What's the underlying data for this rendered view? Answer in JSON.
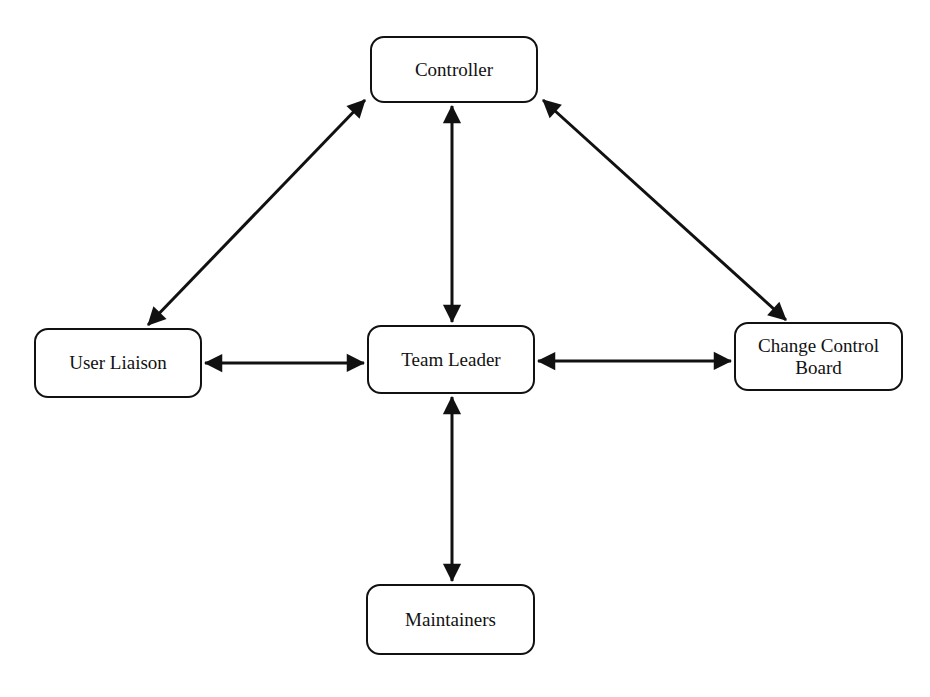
{
  "diagram": {
    "type": "organizational-communication-diagram",
    "nodes": {
      "controller": {
        "label": "Controller"
      },
      "user_liaison": {
        "label": "User Liaison"
      },
      "team_leader": {
        "label": "Team Leader"
      },
      "change_control_board": {
        "label": "Change Control Board"
      },
      "maintainers": {
        "label": "Maintainers"
      }
    },
    "edges": [
      {
        "from": "controller",
        "to": "user_liaison",
        "direction": "bidirectional"
      },
      {
        "from": "controller",
        "to": "team_leader",
        "direction": "bidirectional"
      },
      {
        "from": "controller",
        "to": "change_control_board",
        "direction": "bidirectional"
      },
      {
        "from": "user_liaison",
        "to": "team_leader",
        "direction": "bidirectional"
      },
      {
        "from": "team_leader",
        "to": "change_control_board",
        "direction": "bidirectional"
      },
      {
        "from": "team_leader",
        "to": "maintainers",
        "direction": "bidirectional"
      }
    ],
    "colors": {
      "stroke": "#111111",
      "background": "#ffffff"
    }
  }
}
